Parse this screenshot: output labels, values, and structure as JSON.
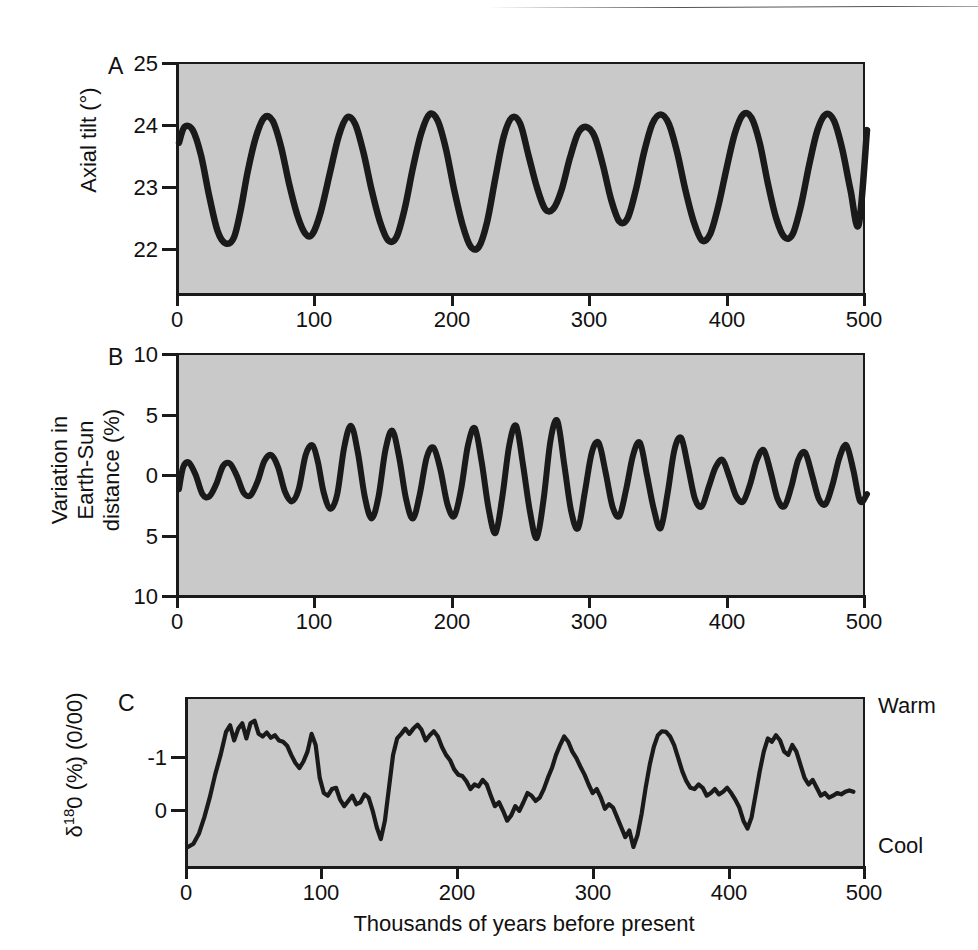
{
  "figure": {
    "background_color": "#ffffff",
    "plot_fill_color": "#c9c9c9",
    "line_color": "#1a1a1a",
    "xaxis_title": "Thousands of years before present"
  },
  "panels": [
    {
      "letter": "A",
      "ylabel": "Axial tilt (°)",
      "yticks": [
        "25",
        "24",
        "23",
        "22"
      ]
    },
    {
      "letter": "B",
      "ylabel_line1": "Variation in",
      "ylabel_line2": "Earth-Sun",
      "ylabel_line3": "distance (%)",
      "yticks": [
        "10",
        "5",
        "0",
        "5",
        "10"
      ]
    },
    {
      "letter": "C",
      "ylabel_prefix": "δ",
      "ylabel_sup": "18",
      "ylabel_suffix": "0 (%̦) (0/00)",
      "yticks": [
        "-1",
        "0"
      ],
      "top_label": "Warm",
      "bottom_label": "Cool"
    }
  ],
  "xticks": [
    "0",
    "100",
    "200",
    "300",
    "400",
    "500"
  ],
  "chart_data": [
    {
      "type": "line",
      "panel": "A",
      "title": "Axial tilt (obliquity) over the past 500 kyr",
      "xlabel": "Thousands of years before present",
      "ylabel": "Axial tilt (°)",
      "xlim": [
        0,
        500
      ],
      "ylim": [
        21.3,
        25
      ],
      "ytick_values": [
        22,
        23,
        24,
        25
      ],
      "xtick_values": [
        0,
        100,
        200,
        300,
        400,
        500
      ],
      "grid": false,
      "legend": "none",
      "period_kyr": 41,
      "x": [
        0,
        4,
        10,
        16,
        22,
        28,
        34,
        40,
        45,
        50,
        56,
        62,
        68,
        74,
        80,
        86,
        92,
        97,
        103,
        110,
        116,
        122,
        128,
        134,
        140,
        146,
        152,
        158,
        164,
        170,
        176,
        182,
        188,
        194,
        200,
        206,
        212,
        218,
        224,
        230,
        236,
        242,
        248,
        254,
        260,
        266,
        272,
        278,
        284,
        290,
        296,
        302,
        308,
        314,
        320,
        326,
        332,
        338,
        344,
        350,
        356,
        362,
        368,
        374,
        380,
        386,
        392,
        398,
        404,
        410,
        416,
        422,
        428,
        434,
        440,
        446,
        452,
        458,
        464,
        470,
        476,
        482,
        488,
        494,
        500
      ],
      "y": [
        23.75,
        24.0,
        23.95,
        23.55,
        22.9,
        22.35,
        22.15,
        22.25,
        22.7,
        23.3,
        23.85,
        24.15,
        24.1,
        23.7,
        23.1,
        22.6,
        22.3,
        22.3,
        22.65,
        23.3,
        23.85,
        24.15,
        24.05,
        23.6,
        23.0,
        22.5,
        22.2,
        22.25,
        22.7,
        23.35,
        23.9,
        24.2,
        24.1,
        23.65,
        23.0,
        22.45,
        22.1,
        22.1,
        22.5,
        23.2,
        23.85,
        24.15,
        24.05,
        23.55,
        23.05,
        22.7,
        22.7,
        23.0,
        23.5,
        23.9,
        24.0,
        23.85,
        23.4,
        22.85,
        22.5,
        22.55,
        23.0,
        23.6,
        24.05,
        24.2,
        24.05,
        23.6,
        23.0,
        22.5,
        22.2,
        22.3,
        22.75,
        23.35,
        23.9,
        24.2,
        24.15,
        23.75,
        23.1,
        22.55,
        22.25,
        22.3,
        22.75,
        23.4,
        23.95,
        24.2,
        24.1,
        23.65,
        23.0,
        22.45,
        23.95
      ]
    },
    {
      "type": "line",
      "panel": "B",
      "title": "Variation in Earth-Sun distance (precession) over the past 500 kyr",
      "xlabel": "Thousands of years before present",
      "ylabel": "Variation in Earth-Sun distance (%)",
      "xlim": [
        0,
        500
      ],
      "ylim": [
        -10,
        10
      ],
      "ytick_values": [
        10,
        5,
        0,
        -5,
        -10
      ],
      "ytick_labels": [
        "10",
        "5",
        "0",
        "5",
        "10"
      ],
      "xtick_values": [
        0,
        100,
        200,
        300,
        400,
        500
      ],
      "grid": false,
      "legend": "none",
      "period_kyr": 23,
      "x": [
        0,
        3,
        7,
        12,
        17,
        22,
        27,
        32,
        37,
        42,
        47,
        52,
        57,
        62,
        67,
        72,
        77,
        82,
        87,
        92,
        97,
        101,
        105,
        110,
        115,
        120,
        125,
        130,
        135,
        140,
        145,
        150,
        155,
        160,
        165,
        170,
        175,
        180,
        185,
        190,
        195,
        200,
        205,
        210,
        215,
        220,
        225,
        230,
        235,
        240,
        245,
        250,
        255,
        260,
        265,
        270,
        275,
        280,
        285,
        290,
        295,
        300,
        305,
        310,
        315,
        320,
        325,
        330,
        335,
        340,
        345,
        350,
        355,
        360,
        365,
        370,
        375,
        380,
        385,
        390,
        395,
        400,
        405,
        410,
        415,
        420,
        425,
        430,
        435,
        440,
        445,
        450,
        455,
        460,
        465,
        470,
        475,
        480,
        485,
        490,
        495,
        500
      ],
      "y": [
        -1.0,
        0.8,
        1.2,
        0.2,
        -1.4,
        -1.6,
        -0.6,
        0.9,
        1.1,
        0.1,
        -1.3,
        -1.5,
        -0.4,
        1.3,
        1.8,
        0.8,
        -1.2,
        -2.0,
        -1.0,
        1.8,
        2.6,
        1.2,
        -1.2,
        -2.6,
        -1.4,
        2.4,
        4.2,
        2.0,
        -1.6,
        -3.4,
        -1.6,
        2.2,
        3.8,
        1.6,
        -1.8,
        -3.4,
        -1.4,
        1.6,
        2.4,
        0.6,
        -2.2,
        -3.2,
        -1.0,
        2.6,
        4.0,
        1.2,
        -2.6,
        -4.6,
        -1.6,
        2.6,
        4.2,
        1.0,
        -2.8,
        -5.0,
        -1.8,
        3.0,
        4.6,
        1.0,
        -2.8,
        -4.2,
        -1.2,
        2.0,
        2.8,
        0.4,
        -2.4,
        -3.2,
        -1.0,
        1.8,
        2.8,
        0.2,
        -2.6,
        -4.2,
        -1.4,
        2.2,
        3.2,
        0.8,
        -1.8,
        -2.4,
        -0.8,
        0.8,
        1.4,
        0.0,
        -1.6,
        -2.0,
        -0.6,
        1.4,
        2.2,
        0.4,
        -1.8,
        -2.4,
        -0.8,
        1.4,
        2.0,
        0.2,
        -1.8,
        -2.2,
        -0.6,
        1.6,
        2.6,
        0.6,
        -2.0,
        -1.4
      ]
    },
    {
      "type": "line",
      "panel": "C",
      "title": "δ¹⁸O (‰) benthic record over the past 500 kyr",
      "xlabel": "Thousands of years before present",
      "ylabel": "δ¹⁸O (‰)",
      "xlim": [
        0,
        500
      ],
      "ylim": [
        -1.85,
        0.75
      ],
      "ytick_values": [
        -1,
        0
      ],
      "xtick_values": [
        0,
        100,
        200,
        300,
        400,
        500
      ],
      "grid": false,
      "legend": "none",
      "y_direction_top": "Warm",
      "y_direction_bottom": "Cool",
      "x": [
        0,
        4,
        8,
        12,
        16,
        20,
        24,
        28,
        31,
        34,
        37,
        40,
        43,
        46,
        49,
        52,
        55,
        58,
        61,
        64,
        67,
        70,
        73,
        76,
        79,
        82,
        85,
        88,
        91,
        94,
        97,
        100,
        103,
        106,
        109,
        112,
        115,
        118,
        121,
        124,
        127,
        130,
        133,
        136,
        139,
        142,
        145,
        148,
        151,
        154,
        157,
        160,
        163,
        166,
        169,
        172,
        175,
        178,
        181,
        184,
        187,
        190,
        193,
        196,
        199,
        202,
        205,
        208,
        211,
        214,
        217,
        220,
        223,
        226,
        229,
        232,
        235,
        238,
        241,
        244,
        247,
        250,
        253,
        256,
        259,
        262,
        265,
        268,
        271,
        274,
        277,
        280,
        283,
        286,
        289,
        292,
        295,
        298,
        301,
        304,
        307,
        310,
        313,
        316,
        319,
        322,
        325,
        328,
        331,
        334,
        337,
        340,
        343,
        346,
        349,
        352,
        355,
        358,
        361,
        364,
        367,
        370,
        373,
        376,
        379,
        382,
        385,
        388,
        391,
        394,
        397,
        400,
        403,
        406,
        409,
        412,
        415,
        418,
        421,
        424,
        427,
        430,
        433,
        436,
        439,
        442,
        445,
        448,
        451,
        454,
        457,
        460,
        463,
        466,
        469,
        472,
        475,
        478,
        481,
        484,
        487,
        490,
        493,
        496,
        500
      ],
      "y": [
        -1.5,
        -1.45,
        -1.3,
        -1.05,
        -0.75,
        -0.4,
        -0.1,
        0.25,
        0.35,
        0.12,
        0.3,
        0.38,
        0.15,
        0.38,
        0.42,
        0.22,
        0.18,
        0.24,
        0.16,
        0.2,
        0.12,
        0.1,
        0.04,
        -0.1,
        -0.22,
        -0.3,
        -0.2,
        -0.05,
        0.22,
        0.05,
        -0.45,
        -0.68,
        -0.72,
        -0.62,
        -0.6,
        -0.78,
        -0.88,
        -0.8,
        -0.72,
        -0.85,
        -0.82,
        -0.7,
        -0.75,
        -0.95,
        -1.2,
        -1.38,
        -1.1,
        -0.6,
        -0.1,
        0.15,
        0.22,
        0.3,
        0.22,
        0.3,
        0.36,
        0.28,
        0.12,
        0.2,
        0.26,
        0.18,
        0.02,
        -0.1,
        -0.18,
        -0.32,
        -0.4,
        -0.42,
        -0.5,
        -0.62,
        -0.55,
        -0.58,
        -0.48,
        -0.55,
        -0.72,
        -0.88,
        -0.82,
        -0.95,
        -1.1,
        -1.02,
        -0.88,
        -0.95,
        -0.82,
        -0.68,
        -0.72,
        -0.8,
        -0.75,
        -0.62,
        -0.45,
        -0.3,
        -0.1,
        0.05,
        0.18,
        0.1,
        -0.05,
        -0.15,
        -0.28,
        -0.4,
        -0.55,
        -0.68,
        -0.62,
        -0.75,
        -0.92,
        -0.85,
        -0.9,
        -1.05,
        -1.2,
        -1.35,
        -1.25,
        -1.5,
        -1.32,
        -1.0,
        -0.6,
        -0.25,
        0.02,
        0.2,
        0.26,
        0.25,
        0.18,
        0.05,
        -0.15,
        -0.35,
        -0.5,
        -0.6,
        -0.62,
        -0.55,
        -0.6,
        -0.72,
        -0.68,
        -0.62,
        -0.7,
        -0.66,
        -0.6,
        -0.68,
        -0.78,
        -0.9,
        -1.1,
        -1.22,
        -1.05,
        -0.7,
        -0.35,
        -0.05,
        0.15,
        0.1,
        0.2,
        0.12,
        -0.05,
        -0.1,
        0.05,
        -0.05,
        -0.25,
        -0.45,
        -0.55,
        -0.48,
        -0.6,
        -0.72,
        -0.68,
        -0.75,
        -0.72,
        -0.68,
        -0.7,
        -0.66,
        -0.64,
        -0.66
      ]
    }
  ]
}
